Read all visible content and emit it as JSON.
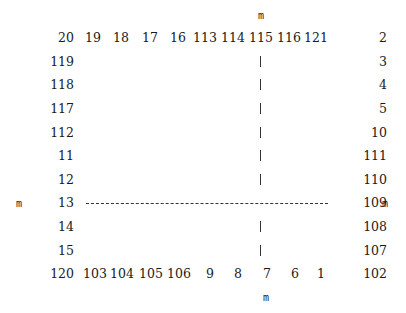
{
  "markers": {
    "top": "m",
    "bottom": "m",
    "left": "m",
    "right": "m"
  },
  "top_row": [
    "20",
    "19",
    "18",
    "17",
    "16",
    "113",
    "114",
    "115",
    "116",
    "121",
    "2"
  ],
  "left_column": [
    "119",
    "118",
    "117",
    "112",
    "11",
    "12",
    "13",
    "14",
    "15"
  ],
  "right_column": [
    "3",
    "4",
    "5",
    "10",
    "111",
    "110",
    "109",
    "108",
    "107"
  ],
  "bottom_row": [
    "120",
    "103",
    "104",
    "105",
    "106",
    "9",
    "8",
    "7",
    "6",
    "1",
    "102"
  ],
  "center_line": {
    "vertical_marks": 8,
    "horizontal_dashed_row": "13-109"
  }
}
